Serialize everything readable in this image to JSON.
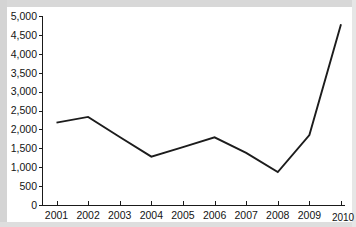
{
  "chart_data": {
    "type": "line",
    "title": "",
    "subtitle": "",
    "xlabel": "",
    "ylabel": "",
    "categories": [
      "2001",
      "2002",
      "2003",
      "2004",
      "2005",
      "2006",
      "2007",
      "2008",
      "2009",
      "2010"
    ],
    "x": [
      2001,
      2002,
      2003,
      2004,
      2005,
      2006,
      2007,
      2008,
      2009,
      2010
    ],
    "series": [
      {
        "name": "",
        "values": [
          2180,
          2330,
          1800,
          1280,
          1530,
          1790,
          1380,
          870,
          1850,
          4780
        ]
      }
    ],
    "values": [
      2180,
      2330,
      1800,
      1280,
      1530,
      1790,
      1380,
      870,
      1850,
      4780
    ],
    "ylim": [
      0,
      5000
    ],
    "yticks": [
      0,
      500,
      1000,
      1500,
      2000,
      2500,
      3000,
      3500,
      4000,
      4500,
      5000
    ],
    "ytick_labels": [
      "0",
      "500",
      "1,000",
      "1,500",
      "2,000",
      "2,500",
      "3,000",
      "3,500",
      "4,000",
      "4,500",
      "5,000"
    ],
    "xtick_labels": [
      "2001",
      "2002",
      "2003",
      "2004",
      "2005",
      "2006",
      "2007",
      "2008",
      "2009",
      "2010"
    ],
    "grid": false,
    "legend": false,
    "legend_position": "none",
    "line_color": "#1c1c1c",
    "axis_color": "#1a1a1a",
    "background_color": "#ffffff",
    "annotations": []
  }
}
